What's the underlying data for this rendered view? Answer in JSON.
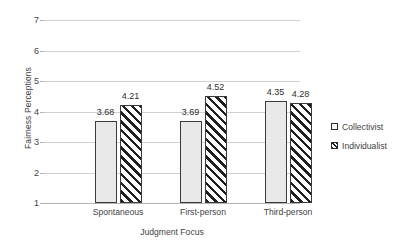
{
  "chart_data": {
    "type": "bar",
    "title": "",
    "xlabel": "Judgment Focus",
    "ylabel": "Fairness Perceptions",
    "categories": [
      "Spontaneous",
      "First-person",
      "Third-person"
    ],
    "series": [
      {
        "name": "Collectivist",
        "values": [
          3.68,
          3.69,
          4.35
        ],
        "style": "solid-light-gray"
      },
      {
        "name": "Individualist",
        "values": [
          4.21,
          4.52,
          4.28
        ],
        "style": "diagonal-hatch"
      }
    ],
    "value_labels": [
      "3.68",
      "4.21",
      "3.69",
      "4.52",
      "4.35",
      "4.28"
    ],
    "ylim": [
      1,
      7
    ],
    "yticks": [
      "7",
      "6",
      "5",
      "4",
      "3",
      "2",
      "1"
    ],
    "grid": true,
    "legend_position": "right"
  },
  "legend": {
    "items": [
      {
        "label": "Collectivist"
      },
      {
        "label": "Individualist"
      }
    ]
  }
}
